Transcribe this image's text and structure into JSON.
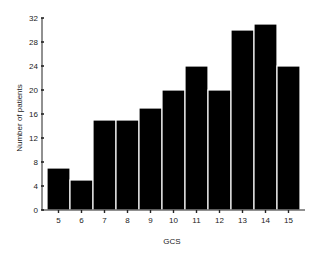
{
  "chart_data": {
    "type": "bar",
    "title": "",
    "xlabel": "GCS",
    "ylabel": "Number of patients",
    "categories": [
      "5",
      "6",
      "7",
      "8",
      "9",
      "10",
      "11",
      "12",
      "13",
      "14",
      "15"
    ],
    "values": [
      7,
      5,
      15,
      15,
      17,
      20,
      24,
      20,
      30,
      31,
      24
    ],
    "ylim": [
      0,
      32
    ],
    "yticks": [
      0,
      4,
      8,
      12,
      16,
      20,
      24,
      28,
      32
    ],
    "grid": false,
    "legend": null,
    "bar_color": "#000000",
    "bar_edge_color": "#ffffff"
  }
}
